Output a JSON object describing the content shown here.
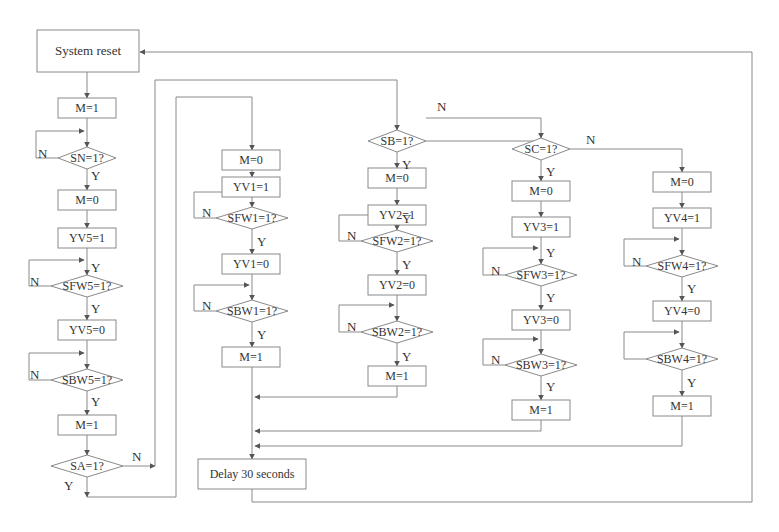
{
  "diagram": {
    "type": "flowchart",
    "colors": {
      "stroke": "#8a8a8a",
      "text": "#333333",
      "background": "#ffffff"
    },
    "nodes": [
      {
        "id": "reset",
        "kind": "rect",
        "label": "System reset",
        "x": 37,
        "y": 30,
        "w": 102,
        "h": 42
      },
      {
        "id": "m1a",
        "kind": "rect",
        "label": "M=1",
        "x": 58,
        "y": 98,
        "w": 58,
        "h": 20
      },
      {
        "id": "sn",
        "kind": "diamond",
        "label": "SN=1?",
        "cx": 87,
        "cy": 158,
        "w": 58,
        "h": 22
      },
      {
        "id": "m0a",
        "kind": "rect",
        "label": "M=0",
        "x": 58,
        "y": 190,
        "w": 58,
        "h": 20
      },
      {
        "id": "yv5on",
        "kind": "rect",
        "label": "YV5=1",
        "x": 58,
        "y": 228,
        "w": 58,
        "h": 20
      },
      {
        "id": "sfw5",
        "kind": "diamond",
        "label": "SFW5=1?",
        "cx": 87,
        "cy": 286,
        "w": 72,
        "h": 22
      },
      {
        "id": "yv5off",
        "kind": "rect",
        "label": "YV5=0",
        "x": 58,
        "y": 320,
        "w": 58,
        "h": 20
      },
      {
        "id": "sbw5",
        "kind": "diamond",
        "label": "SBW5=1?",
        "cx": 87,
        "cy": 380,
        "w": 72,
        "h": 22
      },
      {
        "id": "m1b",
        "kind": "rect",
        "label": "M=1",
        "x": 58,
        "y": 415,
        "w": 58,
        "h": 20
      },
      {
        "id": "sa",
        "kind": "diamond",
        "label": "SA=1?",
        "cx": 87,
        "cy": 466,
        "w": 72,
        "h": 22
      },
      {
        "id": "m0_1",
        "kind": "rect",
        "label": "M=0",
        "x": 222,
        "y": 150,
        "w": 58,
        "h": 20
      },
      {
        "id": "yv1on",
        "kind": "rect",
        "label": "YV1=1",
        "x": 222,
        "y": 160,
        "w": 58,
        "h": 20
      },
      {
        "id": "sfw1",
        "kind": "diamond",
        "label": "SFW1=1?",
        "cx": 252,
        "cy": 218,
        "w": 72,
        "h": 22
      },
      {
        "id": "yv1off",
        "kind": "rect",
        "label": "YV1=0",
        "x": 222,
        "y": 254,
        "w": 58,
        "h": 20
      },
      {
        "id": "sbw1",
        "kind": "diamond",
        "label": "SBW1=1?",
        "cx": 252,
        "cy": 311,
        "w": 72,
        "h": 22
      },
      {
        "id": "m1_1",
        "kind": "rect",
        "label": "M=1",
        "x": 222,
        "y": 347,
        "w": 58,
        "h": 20
      },
      {
        "id": "sb",
        "kind": "diamond",
        "label": "SB=1?",
        "cx": 397,
        "cy": 141,
        "w": 58,
        "h": 22
      },
      {
        "id": "m0_2",
        "kind": "rect",
        "label": "M=0",
        "x": 368,
        "y": 178,
        "w": 58,
        "h": 20
      },
      {
        "id": "yv2on",
        "kind": "rect",
        "label": "YV2=1",
        "x": 368,
        "y": 185,
        "w": 58,
        "h": 20
      },
      {
        "id": "sfw2",
        "kind": "diamond",
        "label": "SFW2=1?",
        "cx": 397,
        "cy": 241,
        "w": 72,
        "h": 22
      },
      {
        "id": "yv2off",
        "kind": "rect",
        "label": "YV2=0",
        "x": 368,
        "y": 275,
        "w": 58,
        "h": 20
      },
      {
        "id": "sbw2",
        "kind": "diamond",
        "label": "SBW2=1?",
        "cx": 397,
        "cy": 332,
        "w": 72,
        "h": 22
      },
      {
        "id": "m1_2",
        "kind": "rect",
        "label": "M=1",
        "x": 368,
        "y": 366,
        "w": 58,
        "h": 20
      },
      {
        "id": "sc",
        "kind": "diamond",
        "label": "SC=1?",
        "cx": 541,
        "cy": 149,
        "w": 58,
        "h": 22
      },
      {
        "id": "m0_3",
        "kind": "rect",
        "label": "M=0",
        "x": 512,
        "y": 181,
        "w": 58,
        "h": 20
      },
      {
        "id": "yv3on",
        "kind": "rect",
        "label": "YV3=1",
        "x": 512,
        "y": 217,
        "w": 58,
        "h": 20
      },
      {
        "id": "sfw3",
        "kind": "diamond",
        "label": "SFW3=1?",
        "cx": 541,
        "cy": 275,
        "w": 72,
        "h": 22
      },
      {
        "id": "yv3off",
        "kind": "rect",
        "label": "YV3=0",
        "x": 512,
        "y": 310,
        "w": 58,
        "h": 20
      },
      {
        "id": "sbw3",
        "kind": "diamond",
        "label": "SBW3=1?",
        "cx": 541,
        "cy": 365,
        "w": 72,
        "h": 22
      },
      {
        "id": "m1_3",
        "kind": "rect",
        "label": "M=1",
        "x": 512,
        "y": 400,
        "w": 58,
        "h": 20
      },
      {
        "id": "m0_4",
        "kind": "rect",
        "label": "M=0",
        "x": 653,
        "y": 172,
        "w": 58,
        "h": 20
      },
      {
        "id": "yv4on",
        "kind": "rect",
        "label": "YV4=1",
        "x": 653,
        "y": 208,
        "w": 58,
        "h": 20
      },
      {
        "id": "sfw4",
        "kind": "diamond",
        "label": "SFW4=1?",
        "cx": 682,
        "cy": 266,
        "w": 72,
        "h": 22
      },
      {
        "id": "yv4off",
        "kind": "rect",
        "label": "YV4=0",
        "x": 653,
        "y": 301,
        "w": 58,
        "h": 20
      },
      {
        "id": "sbw4",
        "kind": "diamond",
        "label": "SBW4=1?",
        "cx": 682,
        "cy": 359,
        "w": 72,
        "h": 22
      },
      {
        "id": "m1_4",
        "kind": "rect",
        "label": "M=1",
        "x": 653,
        "y": 396,
        "w": 58,
        "h": 20
      },
      {
        "id": "delay",
        "kind": "rect",
        "label": "Delay 30 seconds",
        "x": 198,
        "y": 459,
        "w": 108,
        "h": 30
      }
    ],
    "branch_labels": [
      {
        "text": "Y",
        "x": 91,
        "y": 180
      },
      {
        "text": "N",
        "x": 38,
        "y": 158
      },
      {
        "text": "Y",
        "x": 91,
        "y": 272
      },
      {
        "text": "N",
        "x": 30,
        "y": 286
      },
      {
        "text": "Y",
        "x": 91,
        "y": 313
      },
      {
        "text": "N",
        "x": 30,
        "y": 379
      },
      {
        "text": "Y",
        "x": 91,
        "y": 406
      },
      {
        "text": "N",
        "x": 132,
        "y": 461
      },
      {
        "text": "Y",
        "x": 64,
        "y": 490
      },
      {
        "text": "Y",
        "x": 257,
        "y": 246
      },
      {
        "text": "N",
        "x": 202,
        "y": 217
      },
      {
        "text": "Y",
        "x": 257,
        "y": 339
      },
      {
        "text": "N",
        "x": 202,
        "y": 310
      },
      {
        "text": "N",
        "x": 437,
        "y": 111
      },
      {
        "text": "Y",
        "x": 402,
        "y": 169
      },
      {
        "text": "Y",
        "x": 402,
        "y": 223
      },
      {
        "text": "N",
        "x": 347,
        "y": 240
      },
      {
        "text": "Y",
        "x": 402,
        "y": 269
      },
      {
        "text": "N",
        "x": 347,
        "y": 331
      },
      {
        "text": "Y",
        "x": 402,
        "y": 361
      },
      {
        "text": "N",
        "x": 586,
        "y": 144
      },
      {
        "text": "Y",
        "x": 546,
        "y": 176
      },
      {
        "text": "Y",
        "x": 546,
        "y": 257
      },
      {
        "text": "N",
        "x": 491,
        "y": 275
      },
      {
        "text": "Y",
        "x": 546,
        "y": 302
      },
      {
        "text": "N",
        "x": 491,
        "y": 364
      },
      {
        "text": "Y",
        "x": 546,
        "y": 391
      },
      {
        "text": "Y",
        "x": 687,
        "y": 293
      },
      {
        "text": "N",
        "x": 632,
        "y": 266
      },
      {
        "text": "Y",
        "x": 687,
        "y": 387
      }
    ]
  }
}
